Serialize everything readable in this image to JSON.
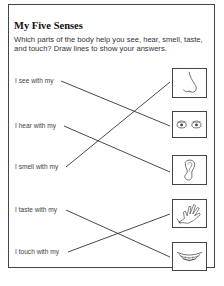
{
  "worksheet": {
    "title": "My Five Senses",
    "instructions": "Which parts of the body help you see, hear, smell, taste, and touch? Draw lines to show your answers.",
    "prompts": [
      {
        "label": "I see with my",
        "answer": "eyes"
      },
      {
        "label": "I hear with my",
        "answer": "ear"
      },
      {
        "label": "I smell with my",
        "answer": "nose"
      },
      {
        "label": "I taste with my",
        "answer": "mouth"
      },
      {
        "label": "I touch with my",
        "answer": "hand"
      }
    ],
    "pictures": [
      {
        "name": "nose",
        "icon": "nose-icon"
      },
      {
        "name": "eyes",
        "icon": "eyes-icon"
      },
      {
        "name": "ear",
        "icon": "ear-icon"
      },
      {
        "name": "hand",
        "icon": "hand-icon"
      },
      {
        "name": "mouth",
        "icon": "mouth-icon"
      }
    ],
    "colors": {
      "ink": "#444444",
      "paper": "#ffffff",
      "title": "#111111"
    }
  }
}
